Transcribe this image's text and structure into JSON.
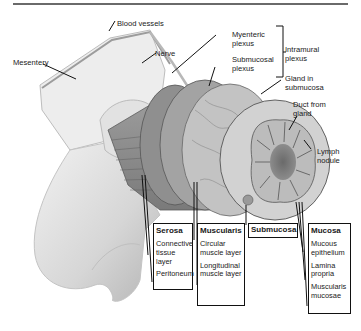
{
  "diagram": {
    "labels": {
      "blood_vessels": "Blood vessels",
      "mesentery": "Mesentery",
      "nerve": "Nerve",
      "myenteric_plexus": "Myenteric plexus",
      "submucosal_plexus": "Submucosal plexus",
      "intramural_plexus": "Intramural plexus",
      "gland_in_submucosa": "Gland in submucosa",
      "duct_from_gland": "Duct from gland",
      "lymph_nodule": "Lymph nodule"
    },
    "layer_boxes": [
      {
        "title": "Serosa",
        "items": [
          "Connective tissue layer",
          "Peritoneum"
        ]
      },
      {
        "title": "Muscularis",
        "items": [
          "Circular muscle layer",
          "Longitudinal muscle layer"
        ]
      },
      {
        "title": "Submucosa",
        "items": []
      },
      {
        "title": "Mucosa",
        "items": [
          "Mucous epithelium",
          "Lamina propria",
          "Muscularis mucosae"
        ]
      }
    ],
    "colors": {
      "line": "#111111",
      "tissue_light": "#e6e6e6",
      "tissue_mid": "#a8a8a8",
      "tissue_dark": "#6e6e6e",
      "rule": "#6a6a6a"
    }
  }
}
